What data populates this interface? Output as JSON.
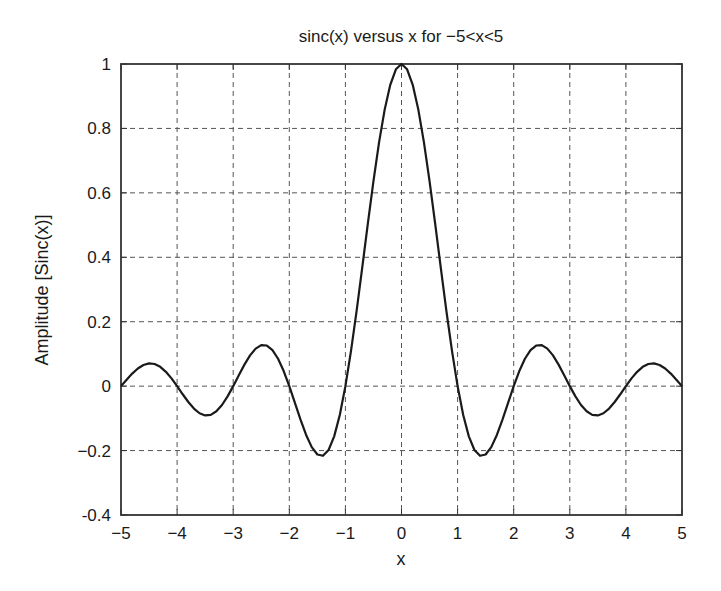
{
  "chart_data": {
    "type": "line",
    "title": "sinc(x) versus x for −5<x<5",
    "xlabel": "x",
    "ylabel": "Amplitude [Sinc(x)]",
    "xlim": [
      -5,
      5
    ],
    "ylim": [
      -0.4,
      1
    ],
    "grid": true,
    "legend": null,
    "x_ticks": [
      -5,
      -4,
      -3,
      -2,
      -1,
      0,
      1,
      2,
      3,
      4,
      5
    ],
    "x_tick_labels": [
      "−5",
      "−4",
      "−3",
      "−2",
      "−1",
      "0",
      "1",
      "2",
      "3",
      "4",
      "5"
    ],
    "y_ticks": [
      -0.4,
      -0.2,
      0,
      0.2,
      0.4,
      0.6,
      0.8,
      1
    ],
    "y_tick_labels": [
      "-0.4",
      "−0.2",
      "0",
      "0.2",
      "0.4",
      "0.6",
      "0.8",
      "1"
    ],
    "series": [
      {
        "name": "sinc(x)",
        "color": "#1a1a1a",
        "x": [
          -5,
          -4.9,
          -4.8,
          -4.7,
          -4.6,
          -4.5,
          -4.4,
          -4.3,
          -4.2,
          -4.1,
          -4,
          -3.9,
          -3.8,
          -3.7,
          -3.6,
          -3.5,
          -3.4,
          -3.3,
          -3.2,
          -3.1,
          -3,
          -2.9,
          -2.8,
          -2.7,
          -2.6,
          -2.5,
          -2.4,
          -2.3,
          -2.2,
          -2.1,
          -2,
          -1.9,
          -1.8,
          -1.7,
          -1.6,
          -1.5,
          -1.4,
          -1.3,
          -1.2,
          -1.1,
          -1,
          -0.9,
          -0.8,
          -0.7,
          -0.6,
          -0.5,
          -0.4,
          -0.3,
          -0.2,
          -0.1,
          0,
          0.1,
          0.2,
          0.3,
          0.4,
          0.5,
          0.6,
          0.7,
          0.8,
          0.9,
          1,
          1.1,
          1.2,
          1.3,
          1.4,
          1.5,
          1.6,
          1.7,
          1.8,
          1.9,
          2,
          2.1,
          2.2,
          2.3,
          2.4,
          2.5,
          2.6,
          2.7,
          2.8,
          2.9,
          3,
          3.1,
          3.2,
          3.3,
          3.4,
          3.5,
          3.6,
          3.7,
          3.8,
          3.9,
          4,
          4.1,
          4.2,
          4.3,
          4.4,
          4.5,
          4.6,
          4.7,
          4.8,
          4.9,
          5
        ],
        "values": [
          0,
          0.0201,
          0.039,
          0.0548,
          0.0658,
          0.0707,
          0.0688,
          0.0599,
          0.0445,
          0.024,
          0,
          -0.0252,
          -0.0492,
          -0.0696,
          -0.0841,
          -0.0909,
          -0.089,
          -0.078,
          -0.0585,
          -0.0317,
          0,
          0.0339,
          0.0668,
          0.0954,
          0.1164,
          0.1273,
          0.1261,
          0.112,
          0.085,
          0.0468,
          0,
          -0.0518,
          -0.1039,
          -0.1515,
          -0.1892,
          -0.2122,
          -0.2162,
          -0.1981,
          -0.1559,
          -0.0894,
          0,
          0.1093,
          0.2339,
          0.3679,
          0.5046,
          0.6366,
          0.7568,
          0.8584,
          0.9355,
          0.9836,
          1,
          0.9836,
          0.9355,
          0.8584,
          0.7568,
          0.6366,
          0.5046,
          0.3679,
          0.2339,
          0.1093,
          0,
          -0.0894,
          -0.1559,
          -0.1981,
          -0.2162,
          -0.2122,
          -0.1892,
          -0.1515,
          -0.1039,
          -0.0518,
          0,
          0.0468,
          0.085,
          0.112,
          0.1261,
          0.1273,
          0.1164,
          0.0954,
          0.0668,
          0.0339,
          0,
          -0.0317,
          -0.0585,
          -0.078,
          -0.089,
          -0.0909,
          -0.0841,
          -0.0696,
          -0.0492,
          -0.0252,
          0,
          0.024,
          0.0445,
          0.0599,
          0.0688,
          0.0707,
          0.0658,
          0.0548,
          0.039,
          0.0201,
          0
        ]
      }
    ]
  },
  "colors": {
    "axis": "#333333",
    "grid": "#555555",
    "line": "#1a1a1a",
    "background": "#ffffff"
  }
}
